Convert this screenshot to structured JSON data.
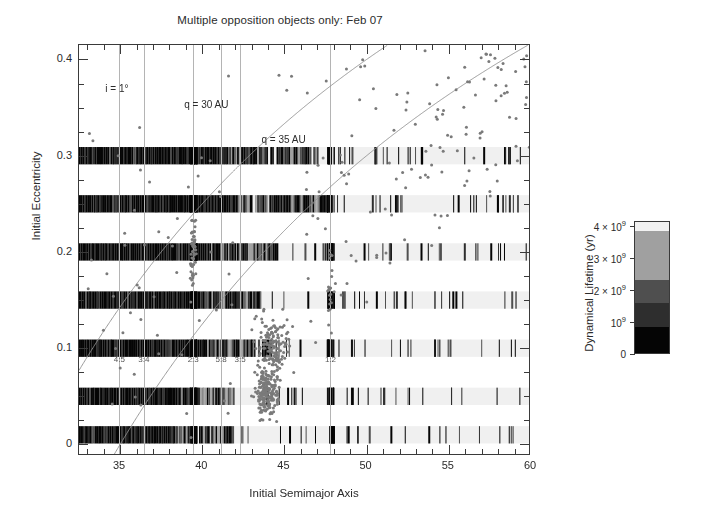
{
  "chart_data": {
    "type": "scatter",
    "title": "Multiple opposition objects only: Feb 07",
    "xlabel": "Initial Semimajor Axis",
    "ylabel": "Initial Eccentricity",
    "xlim": [
      32.5,
      60
    ],
    "ylim": [
      -0.012,
      0.415
    ],
    "xticks": [
      35,
      40,
      45,
      50,
      55,
      60
    ],
    "xticklabels": [
      "35",
      "40",
      "45",
      "50",
      "55",
      "60"
    ],
    "xminor_step": 1,
    "yticks": [
      0,
      0.1,
      0.2,
      0.3,
      0.4
    ],
    "yticklabels": [
      "0",
      "0.1",
      "0.2",
      "0.3",
      "0.4"
    ],
    "yminor_step": 0.025,
    "grid": "vertical-resonance-lines-only",
    "legend": "none",
    "point_color": "#7a7a7a",
    "point_size_px": 3.0,
    "annotations": [
      {
        "text": "i = 1°",
        "x": 34.1,
        "y": 0.368
      },
      {
        "text": "q = 30 AU",
        "x": 38.9,
        "y": 0.352
      },
      {
        "text": "q = 35 AU",
        "x": 43.6,
        "y": 0.315
      }
    ],
    "curves": [
      {
        "name": "q = 30 AU",
        "type": "perihelion",
        "q": 30,
        "comment": "e = 1 - q/a, drawn across axis range"
      },
      {
        "name": "q = 35 AU",
        "type": "perihelion",
        "q": 35,
        "comment": "e = 1 - q/a, drawn across axis range"
      }
    ],
    "resonance_lines": [
      {
        "label": "4:5",
        "a": 34.95
      },
      {
        "label": "3:4",
        "a": 36.45
      },
      {
        "label": "2:3",
        "a": 39.45
      },
      {
        "label": "5:8",
        "a": 41.15
      },
      {
        "label": "3:5",
        "a": 42.3
      },
      {
        "label": "1:2",
        "a": 47.8
      }
    ],
    "resonance_label_y": 0.088,
    "lifetime_bands": {
      "comment": "Dense simulated-particle strips of dynamical lifetime, one per initial eccentricity",
      "eccentricities": [
        0.01,
        0.05,
        0.1,
        0.15,
        0.2,
        0.25,
        0.3
      ],
      "band_height_e": 0.018,
      "a_range": [
        32.5,
        60
      ]
    },
    "scatter_description": "Multiple-opposition Kuiper Belt objects; dense classical belt concentration near a = 42-46 AU with e < 0.2, scattered objects out to a = 60 AU and e up to 0.41"
  },
  "colorbar": {
    "title": "Dynamical Lifetime (yr)",
    "ticks": [
      {
        "value": 0,
        "label": "0"
      },
      {
        "value": 1000000000.0,
        "label": "10⁹"
      },
      {
        "value": 2000000000.0,
        "label": "2 × 10⁹"
      },
      {
        "value": 3000000000.0,
        "label": "3 × 10⁹"
      },
      {
        "value": 4000000000.0,
        "label": "4 × 10⁹"
      }
    ],
    "vmin": 0,
    "vmax": 4150000000.0,
    "segments": [
      {
        "from": 0.0,
        "to": 0.2,
        "color": "#050505"
      },
      {
        "from": 0.2,
        "to": 0.38,
        "color": "#2e2e2e"
      },
      {
        "from": 0.38,
        "to": 0.56,
        "color": "#4f4f4f"
      },
      {
        "from": 0.56,
        "to": 0.93,
        "color": "#a0a0a0"
      },
      {
        "from": 0.93,
        "to": 1.0,
        "color": "#f2f2f2"
      }
    ]
  }
}
